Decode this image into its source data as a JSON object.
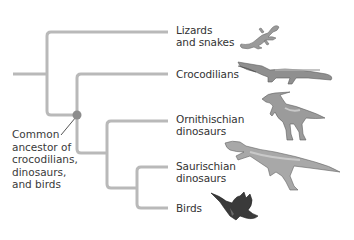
{
  "diagram": {
    "type": "cladogram",
    "line_color": "#b9b9b9",
    "node_color": "#8c8c8c",
    "taxa": [
      {
        "label": "Lizards\nand snakes",
        "icon": "lizard-icon"
      },
      {
        "label": "Crocodilians",
        "icon": "crocodile-icon"
      },
      {
        "label": "Ornithischian\ndinosaurs",
        "icon": "ornithischian-dinosaur-icon"
      },
      {
        "label": "Saurischian\ndinosaurs",
        "icon": "saurischian-dinosaur-icon"
      },
      {
        "label": "Birds",
        "icon": "bird-icon"
      }
    ],
    "callout": {
      "label": "Common\nancestor of\ncrocodilians,\ndinosaurs,\nand birds",
      "points_to": "node-archosaur-ancestor"
    }
  }
}
